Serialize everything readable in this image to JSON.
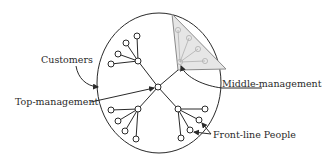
{
  "diagram": {
    "labels": {
      "customers": "Customers",
      "top_management": "Top-management",
      "middle_management": "Middle-management",
      "front_line": "Front-line People"
    },
    "colors": {
      "stroke": "#2a2a2a",
      "triangle_fill": "#e6e6e6",
      "triangle_stroke": "#8a8a8a",
      "background": "#ffffff"
    }
  }
}
